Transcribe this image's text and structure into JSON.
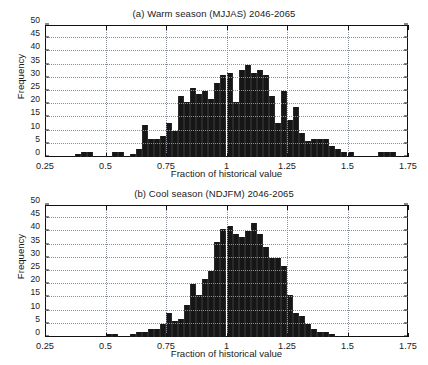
{
  "figure": {
    "width": 428,
    "height": 365,
    "background": "#ffffff",
    "bar_color": "#161616",
    "axis_color": "#111111",
    "grid_color": "#8a8f99"
  },
  "panels": [
    {
      "id": "panel-a",
      "title": "(a) Warm season (MJJAS) 2046-2065",
      "xlabel": "Fraction of historical value",
      "ylabel": "Frequency"
    },
    {
      "id": "panel-b",
      "title": "(b) Cool season (NDJFM) 2046-2065",
      "xlabel": "Fraction of historical value",
      "ylabel": "Frequency"
    }
  ],
  "axis": {
    "xticks": [
      0.25,
      0.5,
      0.75,
      1,
      1.25,
      1.5,
      1.75
    ],
    "xtick_labels": [
      "0.25",
      "0.5",
      "0.75",
      "1",
      "1.25",
      "1.5",
      "1.75"
    ],
    "yticks": [
      0,
      5,
      10,
      15,
      20,
      25,
      30,
      35,
      40,
      45,
      50
    ],
    "ytick_labels": [
      "0",
      "5",
      "10",
      "15",
      "20",
      "25",
      "30",
      "35",
      "40",
      "45",
      "50"
    ],
    "xlim": [
      0.25,
      1.75
    ],
    "ylim": [
      0,
      50
    ],
    "grid": true
  },
  "chart_data": [
    {
      "type": "bar",
      "title": "(a) Warm season (MJJAS) 2046-2065",
      "xlabel": "Fraction of historical value",
      "ylabel": "Frequency",
      "xlim": [
        0.25,
        1.75
      ],
      "ylim": [
        0,
        50
      ],
      "bin_width": 0.025,
      "grid": true,
      "legend": null,
      "bin_left_edges": [
        0.375,
        0.4,
        0.425,
        0.45,
        0.475,
        0.5,
        0.525,
        0.55,
        0.575,
        0.6,
        0.625,
        0.65,
        0.675,
        0.7,
        0.725,
        0.75,
        0.775,
        0.8,
        0.825,
        0.85,
        0.875,
        0.9,
        0.925,
        0.95,
        0.975,
        1.0,
        1.025,
        1.05,
        1.075,
        1.1,
        1.125,
        1.15,
        1.175,
        1.2,
        1.225,
        1.25,
        1.275,
        1.3,
        1.325,
        1.35,
        1.375,
        1.4,
        1.425,
        1.45,
        1.475,
        1.5,
        1.525,
        1.625,
        1.65,
        1.675
      ],
      "values": [
        1,
        2,
        2,
        0,
        0,
        0,
        2,
        2,
        0,
        1,
        3,
        12,
        7,
        7,
        8,
        13,
        10,
        23,
        21,
        26,
        24,
        25,
        22,
        28,
        31,
        32,
        21,
        33,
        35,
        32,
        33,
        31,
        23,
        13,
        25,
        14,
        19,
        9,
        6,
        7,
        7,
        7,
        4,
        3,
        2,
        2,
        0,
        2,
        2,
        2
      ]
    },
    {
      "type": "bar",
      "title": "(b) Cool season (NDJFM) 2046-2065",
      "xlabel": "Fraction of historical value",
      "ylabel": "Frequency",
      "xlim": [
        0.25,
        1.75
      ],
      "ylim": [
        0,
        50
      ],
      "bin_width": 0.025,
      "grid": true,
      "legend": null,
      "bin_left_edges": [
        0.5,
        0.525,
        0.55,
        0.6,
        0.625,
        0.65,
        0.675,
        0.7,
        0.725,
        0.75,
        0.775,
        0.8,
        0.825,
        0.85,
        0.875,
        0.9,
        0.925,
        0.95,
        0.975,
        1.0,
        1.025,
        1.05,
        1.075,
        1.1,
        1.125,
        1.15,
        1.175,
        1.2,
        1.225,
        1.25,
        1.275,
        1.3,
        1.325,
        1.35,
        1.375,
        1.4,
        1.425
      ],
      "values": [
        1,
        1,
        0,
        1,
        2,
        2,
        3,
        3,
        5,
        9,
        6,
        7,
        12,
        20,
        16,
        22,
        25,
        36,
        41,
        42,
        39,
        38,
        40,
        43,
        39,
        34,
        30,
        30,
        27,
        16,
        9,
        8,
        5,
        3,
        2,
        2,
        1
      ]
    }
  ]
}
